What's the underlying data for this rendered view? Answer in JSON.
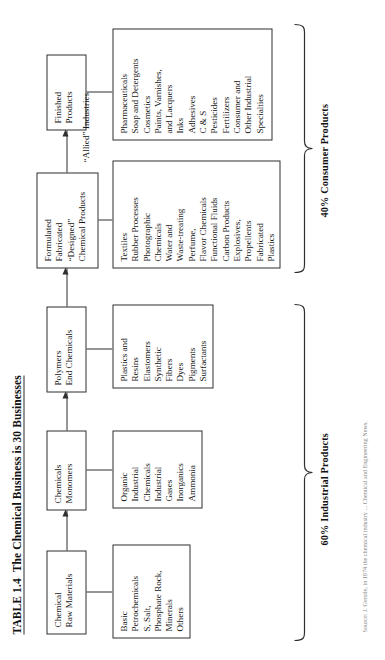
{
  "figure": {
    "table_number": "TABLE 1.4",
    "title": "The Chemical Business is 30 Businesses",
    "caption": "Source: J. Gerstle, in 1974 the chemical industry ... Chemical and Engineering News."
  },
  "stages": [
    {
      "id": "raw-materials",
      "lines": [
        "Chemical",
        "Raw Materials"
      ]
    },
    {
      "id": "chemicals",
      "lines": [
        "Chemicals",
        "Monomers"
      ]
    },
    {
      "id": "polymers",
      "lines": [
        "Polymers",
        "End Chemicals"
      ]
    },
    {
      "id": "formulated",
      "lines": [
        "Formulated",
        "Fabricated",
        "“Designed”",
        "Chemical Products"
      ]
    },
    {
      "id": "finished",
      "lines": [
        "Finished",
        "Products"
      ]
    }
  ],
  "product_lists": [
    {
      "id": "raw-materials-products",
      "items": [
        "Basic",
        "Petrochemicals",
        "S, Salt,",
        "Phosphate Rock,",
        "Minerals",
        "Others"
      ]
    },
    {
      "id": "chemicals-products",
      "items": [
        "Organic",
        "Industrial",
        "Chemicals",
        "Industrial",
        "Gases",
        "Inorganics",
        "Ammonia"
      ]
    },
    {
      "id": "polymers-products",
      "items": [
        "Plastics and",
        "Resins",
        "Elastomers",
        "Synthetic",
        "Fibers",
        "Dyes",
        "Pigments",
        "Surfactants"
      ]
    },
    {
      "id": "formulated-products",
      "items": [
        "Textiles",
        "Rubber Processes",
        "Photographic",
        "Chemicals",
        "Water and",
        "Waste-treating",
        "Perfume,",
        "Flavor Chemicals",
        "Functional Fluids",
        "Carbon Products",
        "Explosives,",
        "Propellents",
        "Fabricated",
        "Plastics"
      ]
    },
    {
      "id": "finished-products-list",
      "items": [
        "Pharmaceuticals",
        "Soap and Detergents",
        "Cosmetics",
        "Paints, Varnishes,",
        "and Lacquers",
        "Inks",
        "Adhesives",
        "C & S",
        "Pesticides",
        "Fertilizers",
        "Consumer and",
        "Other Industrial",
        "Specialties"
      ]
    }
  ],
  "labels": {
    "allied_industries_line1": "“Allied”",
    "allied_industries_line2": "Industries"
  },
  "summaries": {
    "industrial": "60% Industrial Products",
    "consumer": "40% Consumer Products"
  },
  "colors": {
    "ink": "#1b1b1b",
    "rule": "#2f2f2f",
    "paper": "#ffffff",
    "caption": "#8a8a8a"
  }
}
